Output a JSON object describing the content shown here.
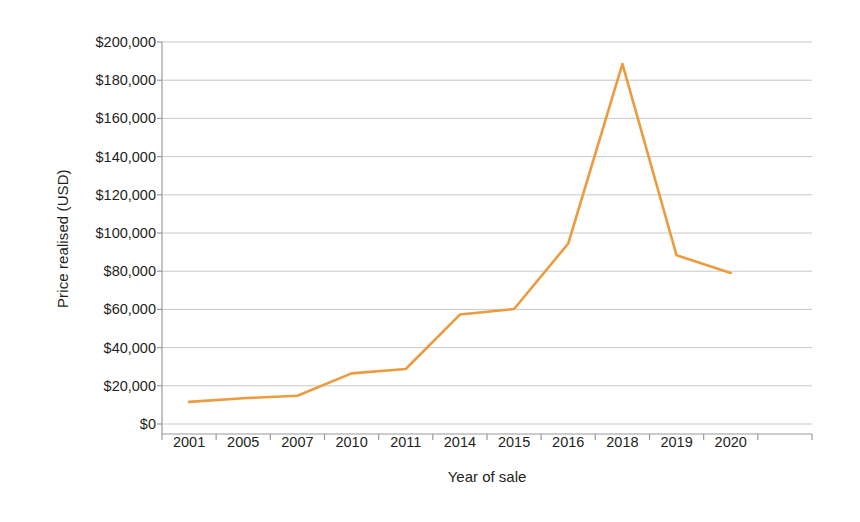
{
  "chart_data": {
    "type": "line",
    "title": "",
    "xlabel": "Year of sale",
    "ylabel": "Price realised (USD)",
    "categories": [
      "2001",
      "2005",
      "2007",
      "2010",
      "2011",
      "2014",
      "2015",
      "2016",
      "2018",
      "2019",
      "2020"
    ],
    "values": [
      11600,
      13500,
      14800,
      26500,
      28800,
      57300,
      60200,
      94500,
      188500,
      88300,
      79100
    ],
    "series": [
      {
        "name": "Price realised (USD)",
        "color": "#ec9c3f",
        "values": [
          11600,
          13500,
          14800,
          26500,
          28800,
          57300,
          60200,
          94500,
          188500,
          88300,
          79100
        ]
      }
    ],
    "ylim": [
      0,
      200000
    ],
    "ytick_values": [
      0,
      20000,
      40000,
      60000,
      80000,
      100000,
      120000,
      140000,
      160000,
      180000,
      200000
    ],
    "ytick_labels": [
      "$0",
      "$20,000",
      "$40,000",
      "$60,000",
      "$80,000",
      "$100,000",
      "$120,000",
      "$140,000",
      "$160,000",
      "$180,000",
      "$200,000"
    ],
    "grid": "horizontal",
    "legend": "none",
    "line_color": "#ec9c3f",
    "line_width": 2.6,
    "axis_color": "#9a9a9a",
    "gridline_color": "#c9c9c9",
    "background_color": "#ffffff",
    "text_color": "#231f20",
    "trailing_empty_category": true
  },
  "axis": {
    "y_title": "Price realised (USD)",
    "x_title": "Year of sale"
  }
}
